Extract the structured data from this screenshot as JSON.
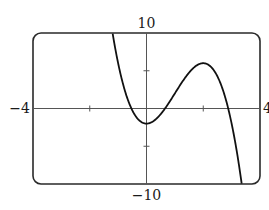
{
  "chart_data": {
    "type": "line",
    "title": "",
    "xlabel": "",
    "ylabel": "",
    "xlim": [
      -4,
      4
    ],
    "ylim": [
      -10,
      10
    ],
    "window_labels": {
      "xmin": "−4",
      "xmax": "4",
      "ymin": "−10",
      "ymax": "10"
    },
    "x_ticks": [
      -4,
      -2,
      0,
      2,
      4
    ],
    "y_ticks": [
      -10,
      -5,
      0,
      5,
      10
    ],
    "grid": false,
    "series": [
      {
        "name": "f(x)",
        "approx_formula": "y = -2x^3 + 6x^2 - 2",
        "key_points": {
          "local_min": [
            0,
            -2
          ],
          "local_max": [
            2,
            6
          ],
          "x_intercepts": [
            -0.53,
            0.65,
            2.88
          ]
        },
        "x": [
          -1.2,
          -1.0,
          -0.8,
          -0.6,
          -0.4,
          -0.2,
          0.0,
          0.2,
          0.4,
          0.6,
          0.8,
          1.0,
          1.2,
          1.4,
          1.6,
          1.8,
          2.0,
          2.2,
          2.4,
          2.6,
          2.8,
          3.0,
          3.2,
          3.3
        ],
        "values": [
          10.1,
          6.0,
          2.9,
          0.6,
          -0.9,
          -1.7,
          -2.0,
          -1.8,
          -1.2,
          -0.3,
          0.8,
          2.0,
          3.2,
          4.3,
          5.2,
          5.8,
          6.0,
          5.7,
          4.9,
          3.4,
          1.1,
          -2.0,
          -6.1,
          -8.6
        ]
      }
    ],
    "frame": "rounded-rectangle"
  }
}
